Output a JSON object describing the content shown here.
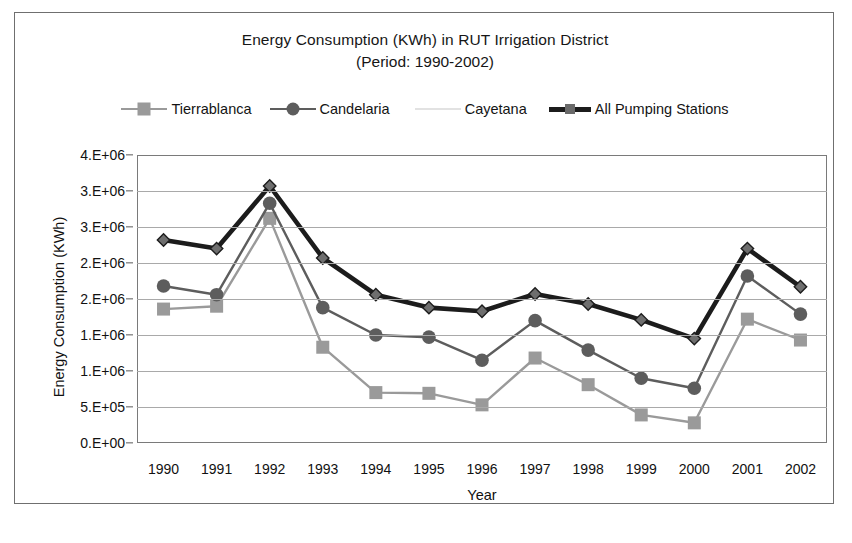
{
  "chart_data": {
    "type": "line",
    "title": "Energy Consumption (KWh) in RUT Irrigation District",
    "subtitle": "(Period: 1990-2002)",
    "xlabel": "Year",
    "ylabel": "Energy Consumption (KWh)",
    "categories": [
      "1990",
      "1991",
      "1992",
      "1993",
      "1994",
      "1995",
      "1996",
      "1997",
      "1998",
      "1999",
      "2000",
      "2001",
      "2002"
    ],
    "ylim": [
      0,
      4000000
    ],
    "ytick_values": [
      4000000,
      3500000,
      3000000,
      2500000,
      2000000,
      1500000,
      1000000,
      500000,
      0
    ],
    "ytick_labels": [
      "4.E+06",
      "3.E+06",
      "3.E+06",
      "2.E+06",
      "2.E+06",
      "1.E+06",
      "1.E+06",
      "5.E+05",
      "0.E+00"
    ],
    "grid": true,
    "legend_position": "top",
    "series": [
      {
        "name": "Tierrablanca",
        "marker": "square",
        "color": "#9a9a9a",
        "line_width": 2.4,
        "values": [
          1860000,
          1900000,
          3120000,
          1330000,
          700000,
          690000,
          530000,
          1180000,
          810000,
          390000,
          280000,
          1720000,
          1430000
        ]
      },
      {
        "name": "Candelaria",
        "marker": "circle",
        "color": "#5d5d5d",
        "line_width": 2.4,
        "values": [
          2180000,
          2060000,
          3330000,
          1880000,
          1500000,
          1470000,
          1150000,
          1700000,
          1290000,
          900000,
          760000,
          2320000,
          1790000
        ]
      },
      {
        "name": "Cayetana",
        "marker": "none",
        "color": "#d8d8d8",
        "line_width": 2.4,
        "values": [
          null,
          null,
          null,
          null,
          null,
          null,
          null,
          null,
          null,
          null,
          null,
          null,
          null
        ]
      },
      {
        "name": "All Pumping Stations",
        "marker": "diamond",
        "color": "#1c1c1c",
        "line_width": 4.6,
        "values": [
          2820000,
          2700000,
          3570000,
          2570000,
          2060000,
          1880000,
          1830000,
          2070000,
          1930000,
          1710000,
          1450000,
          2700000,
          2170000
        ]
      }
    ]
  },
  "legend": {
    "entries": [
      {
        "label": "Tierrablanca"
      },
      {
        "label": "Candelaria"
      },
      {
        "label": "Cayetana"
      },
      {
        "label": "All Pumping Stations"
      }
    ]
  }
}
